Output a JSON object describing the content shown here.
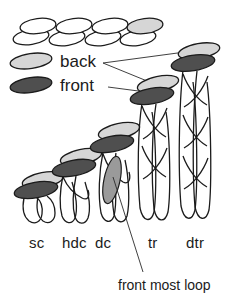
{
  "figure": {
    "type": "diagram"
  },
  "legend": {
    "items": [
      {
        "key": "back",
        "label": "back",
        "swatch_color": "#d6d6d6",
        "swatch_name": "back-loop-swatch"
      },
      {
        "key": "front",
        "label": "front",
        "swatch_color": "#4f4f4f",
        "swatch_name": "front-loop-swatch"
      }
    ]
  },
  "callouts": [
    {
      "key": "front_most_loop",
      "label": "front most loop",
      "points_to": "dc"
    }
  ],
  "chain": {
    "name": "foundation-chain",
    "loop_pairs": 4,
    "highlight_index": 3,
    "highlight_color": "#d6d6d6"
  },
  "colors": {
    "back_loop": "#d6d6d6",
    "front_loop": "#4f4f4f",
    "mid_loop": "#9a9a9a",
    "outline": "#1b1b1b",
    "paper": "#ffffff"
  },
  "stitches": [
    {
      "key": "sc",
      "label": "sc",
      "height_units": 1,
      "twists": 0,
      "has_back_loop": true,
      "has_front_loop": true
    },
    {
      "key": "hdc",
      "label": "hdc",
      "height_units": 2,
      "twists": 1,
      "has_back_loop": true,
      "has_front_loop": true
    },
    {
      "key": "dc",
      "label": "dc",
      "height_units": 3,
      "twists": 1,
      "has_back_loop": true,
      "has_front_loop": true
    },
    {
      "key": "tr",
      "label": "tr",
      "height_units": 4,
      "twists": 2,
      "has_back_loop": true,
      "has_front_loop": true
    },
    {
      "key": "dtr",
      "label": "dtr",
      "height_units": 5,
      "twists": 3,
      "has_back_loop": true,
      "has_front_loop": true
    }
  ]
}
